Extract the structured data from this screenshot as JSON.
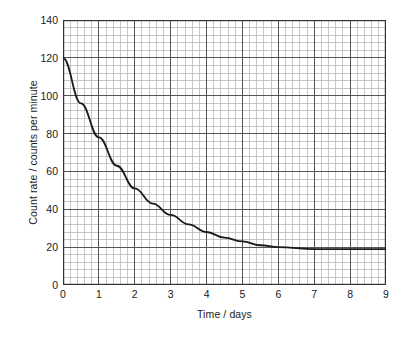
{
  "chart_data": {
    "type": "line",
    "title": "",
    "subtitle": "",
    "xlabel": "Time / days",
    "ylabel": "Count rate / counts per minute",
    "xlim": [
      0,
      9
    ],
    "ylim": [
      0,
      140
    ],
    "x_ticks": [
      0,
      1,
      2,
      3,
      4,
      5,
      6,
      7,
      8,
      9
    ],
    "y_ticks": [
      0,
      20,
      40,
      60,
      80,
      100,
      120,
      140
    ],
    "x_tick_labels": [
      "0",
      "1",
      "2",
      "3",
      "4",
      "5",
      "6",
      "7",
      "8",
      "9"
    ],
    "y_tick_labels": [
      "0",
      "20",
      "40",
      "60",
      "80",
      "100",
      "120",
      "140"
    ],
    "x_minor_per_major": 5,
    "y_minor_per_major": 5,
    "grid": true,
    "grid_major_color": "#555555",
    "grid_minor_color": "#b8b8b8",
    "axis_color": "#333333",
    "legend": null,
    "legend_position": "none",
    "background_color": "#ffffff",
    "series": [
      {
        "name": "Count rate",
        "color": "#1a1a1a",
        "line_width": 1.8,
        "model": "exponential decay to background",
        "initial_count_rate": 120,
        "background_count_rate": 19,
        "half_life_days": 1.5,
        "x": [
          0,
          0.2,
          0.4,
          0.6,
          0.8,
          1.0,
          1.2,
          1.4,
          1.6,
          1.8,
          2.0,
          2.2,
          2.4,
          2.6,
          2.8,
          3.0,
          3.2,
          3.4,
          3.6,
          3.8,
          4.0,
          4.2,
          4.4,
          4.6,
          4.8,
          5.0,
          5.2,
          5.4,
          5.6,
          5.8,
          6.0,
          6.5,
          7.0,
          7.5,
          8.0,
          8.5,
          9.0
        ],
        "y": [
          120.0,
          111.9,
          104.7,
          98.2,
          92.4,
          87.2,
          82.5,
          78.4,
          74.6,
          71.3,
          68.3,
          65.6,
          63.2,
          61.0,
          59.1,
          57.4,
          55.8,
          54.4,
          53.2,
          52.1,
          51.1,
          50.2,
          49.4,
          48.7,
          48.1,
          47.5,
          47.0,
          46.5,
          46.1,
          45.8,
          45.5,
          44.8,
          44.3,
          44.0,
          43.7,
          43.5,
          43.3
        ]
      }
    ],
    "curve_points": [
      {
        "t": 0.0,
        "count_rate": 120
      },
      {
        "t": 0.5,
        "count_rate": 96
      },
      {
        "t": 1.0,
        "count_rate": 78
      },
      {
        "t": 1.5,
        "count_rate": 63
      },
      {
        "t": 2.0,
        "count_rate": 51
      },
      {
        "t": 2.5,
        "count_rate": 43
      },
      {
        "t": 3.0,
        "count_rate": 37
      },
      {
        "t": 3.5,
        "count_rate": 32
      },
      {
        "t": 4.0,
        "count_rate": 28
      },
      {
        "t": 4.5,
        "count_rate": 25
      },
      {
        "t": 5.0,
        "count_rate": 23
      },
      {
        "t": 5.5,
        "count_rate": 21
      },
      {
        "t": 6.0,
        "count_rate": 20
      },
      {
        "t": 7.0,
        "count_rate": 19
      },
      {
        "t": 8.0,
        "count_rate": 19
      },
      {
        "t": 9.0,
        "count_rate": 19
      }
    ]
  }
}
